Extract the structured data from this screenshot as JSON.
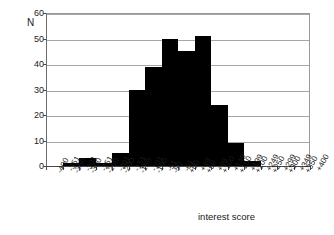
{
  "chart_data": {
    "type": "bar",
    "title": "",
    "subtitle": "",
    "xlabel": "interest score",
    "ylabel": "N",
    "ylim": [
      0,
      60
    ],
    "yticks": [
      0,
      10,
      20,
      30,
      40,
      50,
      60
    ],
    "grid": true,
    "legend": null,
    "categories": [
      "-400 -351",
      "-350 -301",
      "-300 -251",
      "-250 -201",
      "-200 -151",
      "-150 -101",
      "-100 -51",
      "-50 -01",
      "+00 +49",
      "+50 +99",
      "+100 +149",
      "+150 +199",
      "+200 +249",
      "+250 +299",
      "+300 +349",
      "+350 +400"
    ],
    "category_lines": [
      [
        "-400",
        "-351"
      ],
      [
        "-350",
        "-301"
      ],
      [
        "-300",
        "-251"
      ],
      [
        "-250",
        "-201"
      ],
      [
        "-200",
        "-151"
      ],
      [
        "-150",
        "-101"
      ],
      [
        "-100",
        "-51"
      ],
      [
        "-50",
        "-01"
      ],
      [
        "+00",
        "+49"
      ],
      [
        "+50",
        "+99"
      ],
      [
        "+100",
        "+149"
      ],
      [
        "+150",
        "+199"
      ],
      [
        "+200",
        "+249"
      ],
      [
        "+250",
        "+299"
      ],
      [
        "+300",
        "+349"
      ],
      [
        "+350",
        "+400"
      ]
    ],
    "values": [
      0,
      1,
      3,
      1,
      5,
      30,
      39,
      50,
      45,
      51,
      24,
      9,
      2,
      0,
      0,
      0
    ],
    "bar_color": "#000000"
  },
  "colors": {
    "background": "#ffffff",
    "gridline": "#a6a6a6",
    "axis": "#4a4a4a",
    "text": "#1a1a1a",
    "bar": "#000000"
  }
}
